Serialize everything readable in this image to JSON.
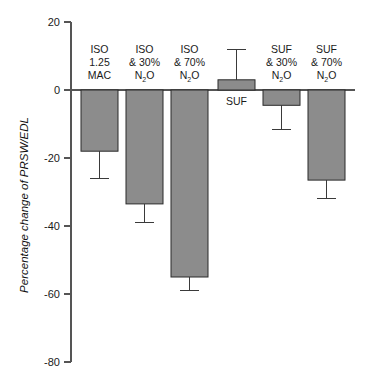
{
  "chart_data": {
    "type": "bar",
    "title": "",
    "subtitle": "",
    "xlabel": "",
    "ylabel": "Percentage change of PRSW/EDL",
    "ylim": [
      -80,
      20
    ],
    "yticks": [
      20,
      0,
      -20,
      -40,
      -60,
      -80
    ],
    "ytick_labels": [
      "20",
      "0",
      "-20",
      "-40",
      "-60",
      "-80"
    ],
    "grid": false,
    "legend": "none",
    "zero_line": true,
    "bar_color": "#8c8c8c",
    "bar_edge_color": "#2b2b2b",
    "axis_color": "#555555",
    "errorbar_color": "#3a3a3a",
    "categories": [
      "ISO 1.25 MAC",
      "ISO & 30% N2O",
      "ISO & 70% N2O",
      "SUF",
      "SUF & 30% N2O",
      "SUF & 70% N2O"
    ],
    "category_label_lines": [
      [
        "ISO",
        "1.25",
        "MAC"
      ],
      [
        "ISO",
        "& 30%",
        "N2O"
      ],
      [
        "ISO",
        "& 70%",
        "N2O"
      ],
      [
        "SUF"
      ],
      [
        "SUF",
        "& 30%",
        "N2O"
      ],
      [
        "SUF",
        "& 70%",
        "N2O"
      ]
    ],
    "values": [
      -18,
      -33.5,
      -55,
      3,
      -4.5,
      -26.5
    ],
    "errors": [
      8,
      5.5,
      4,
      9,
      7,
      5.5
    ],
    "error_extents": [
      -26,
      -39,
      -59,
      12,
      -11.5,
      -32
    ],
    "units": "%"
  },
  "labels": {
    "cat1_l1": "ISO",
    "cat1_l2": "1.25",
    "cat1_l3": "MAC",
    "cat2_l1": "ISO",
    "cat2_l2": "& 30%",
    "cat2_l3a": "N",
    "cat2_l3b": "2",
    "cat2_l3c": "O",
    "cat3_l1": "ISO",
    "cat3_l2": "& 70%",
    "cat3_l3a": "N",
    "cat3_l3b": "2",
    "cat3_l3c": "O",
    "cat4_l1": "SUF",
    "cat5_l1": "SUF",
    "cat5_l2": "& 30%",
    "cat5_l3a": "N",
    "cat5_l3b": "2",
    "cat5_l3c": "O",
    "cat6_l1": "SUF",
    "cat6_l2": "& 70%",
    "cat6_l3a": "N",
    "cat6_l3b": "2",
    "cat6_l3c": "O",
    "ytick0": "20",
    "ytick1": "0",
    "ytick2": "-20",
    "ytick3": "-40",
    "ytick4": "-60",
    "ytick5": "-80",
    "ylabel": "Percentage change of PRSW/EDL"
  }
}
